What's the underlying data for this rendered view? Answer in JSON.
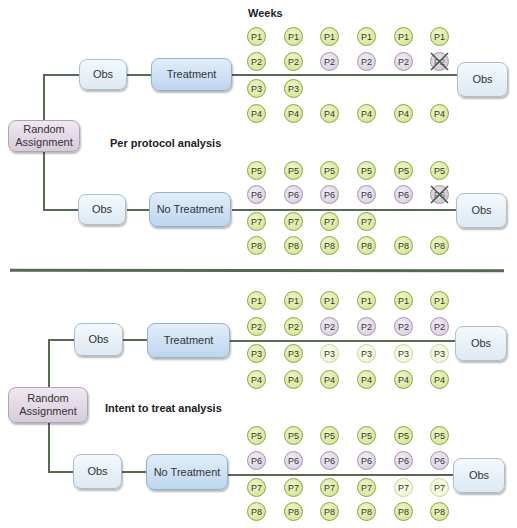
{
  "header": {
    "weeks_label": "Weeks"
  },
  "colors": {
    "adhering": "#cfe38a",
    "switched": "#d6c9de",
    "dropout_imputed": "#eff5cf",
    "line": "#556a4e"
  },
  "per_protocol": {
    "title": "Per protocol analysis",
    "random_assignment": "Random Assignment",
    "treatment_arm": {
      "obs_pre": "Obs",
      "intervention": "Treatment",
      "obs_post": "Obs",
      "rows": [
        {
          "id": "P1",
          "cells": [
            "g",
            "g",
            "g",
            "g",
            "g",
            "g"
          ]
        },
        {
          "id": "P2",
          "cells": [
            "g",
            "g",
            "p",
            "p",
            "p",
            "x"
          ]
        },
        {
          "id": "P3",
          "cells": [
            "g",
            "g",
            "",
            "",
            "",
            ""
          ]
        },
        {
          "id": "P4",
          "cells": [
            "g",
            "g",
            "g",
            "g",
            "g",
            "g"
          ]
        }
      ]
    },
    "control_arm": {
      "obs_pre": "Obs",
      "intervention": "No Treatment",
      "obs_post": "Obs",
      "rows": [
        {
          "id": "P5",
          "cells": [
            "g",
            "g",
            "g",
            "g",
            "g",
            "g"
          ]
        },
        {
          "id": "P6",
          "cells": [
            "p",
            "p",
            "p",
            "p",
            "p",
            "x"
          ]
        },
        {
          "id": "P7",
          "cells": [
            "g",
            "g",
            "g",
            "g",
            "",
            ""
          ]
        },
        {
          "id": "P8",
          "cells": [
            "g",
            "g",
            "g",
            "g",
            "g",
            "g"
          ]
        }
      ]
    }
  },
  "intent_to_treat": {
    "title": "Intent to treat analysis",
    "random_assignment": "Random Assignment",
    "treatment_arm": {
      "obs_pre": "Obs",
      "intervention": "Treatment",
      "obs_post": "Obs",
      "rows": [
        {
          "id": "P1",
          "cells": [
            "g",
            "g",
            "g",
            "g",
            "g",
            "g"
          ]
        },
        {
          "id": "P2",
          "cells": [
            "g",
            "g",
            "p",
            "p",
            "p",
            "p"
          ]
        },
        {
          "id": "P3",
          "cells": [
            "g",
            "g",
            "l",
            "l",
            "l",
            "l"
          ]
        },
        {
          "id": "P4",
          "cells": [
            "g",
            "g",
            "g",
            "g",
            "g",
            "g"
          ]
        }
      ]
    },
    "control_arm": {
      "obs_pre": "Obs",
      "intervention": "No Treatment",
      "obs_post": "Obs",
      "rows": [
        {
          "id": "P5",
          "cells": [
            "g",
            "g",
            "g",
            "g",
            "g",
            "g"
          ]
        },
        {
          "id": "P6",
          "cells": [
            "p",
            "p",
            "p",
            "p",
            "p",
            "p"
          ]
        },
        {
          "id": "P7",
          "cells": [
            "g",
            "g",
            "g",
            "g",
            "l",
            "l"
          ]
        },
        {
          "id": "P8",
          "cells": [
            "g",
            "g",
            "g",
            "g",
            "g",
            "g"
          ]
        }
      ]
    }
  }
}
